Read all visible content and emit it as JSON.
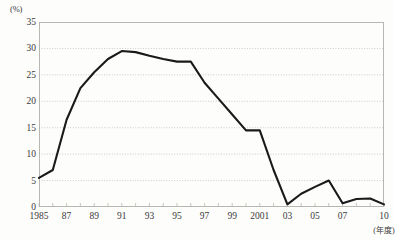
{
  "chart_data": {
    "type": "line",
    "title": "",
    "xlabel": "(年度)",
    "ylabel": "(%)",
    "unit_label": "(%)",
    "x_axis_caption": "(年度)",
    "grid": true,
    "legend": "none",
    "xlim": [
      1985,
      2010
    ],
    "ylim": [
      0,
      35
    ],
    "y_ticks": [
      0,
      5,
      10,
      15,
      20,
      25,
      30,
      35
    ],
    "y_tick_labels": [
      "0",
      "5",
      "10",
      "15",
      "20",
      "25",
      "30",
      "35"
    ],
    "x_ticks": [
      1985,
      1986,
      1987,
      1988,
      1989,
      1990,
      1991,
      1992,
      1993,
      1994,
      1995,
      1996,
      1997,
      1998,
      1999,
      2000,
      2001,
      2002,
      2003,
      2004,
      2005,
      2006,
      2007,
      2008,
      2009,
      2010
    ],
    "x_tick_labels": [
      {
        "x": 1985,
        "label": "1985"
      },
      {
        "x": 1987,
        "label": "87"
      },
      {
        "x": 1989,
        "label": "89"
      },
      {
        "x": 1991,
        "label": "91"
      },
      {
        "x": 1993,
        "label": "93"
      },
      {
        "x": 1995,
        "label": "95"
      },
      {
        "x": 1997,
        "label": "97"
      },
      {
        "x": 1999,
        "label": "99"
      },
      {
        "x": 2001,
        "label": "2001"
      },
      {
        "x": 2003,
        "label": "03"
      },
      {
        "x": 2005,
        "label": "05"
      },
      {
        "x": 2007,
        "label": "07"
      },
      {
        "x": 2010,
        "label": "10"
      }
    ],
    "x": [
      1985,
      1986,
      1987,
      1988,
      1989,
      1990,
      1991,
      1992,
      1993,
      1994,
      1995,
      1996,
      1997,
      1998,
      1999,
      2000,
      2001,
      2002,
      2003,
      2004,
      2005,
      2006,
      2007,
      2008,
      2009,
      2010
    ],
    "values": [
      5.5,
      7.0,
      16.5,
      22.5,
      25.5,
      28.0,
      29.5,
      29.3,
      28.6,
      28.0,
      27.5,
      27.5,
      23.5,
      20.5,
      17.5,
      14.5,
      14.5,
      7.0,
      0.5,
      2.5,
      3.8,
      5.0,
      0.7,
      1.5,
      1.6,
      0.5
    ],
    "series": [
      {
        "name": "",
        "color": "#1a1a1a",
        "values": [
          5.5,
          7.0,
          16.5,
          22.5,
          25.5,
          28.0,
          29.5,
          29.3,
          28.6,
          28.0,
          27.5,
          27.5,
          23.5,
          20.5,
          17.5,
          14.5,
          14.5,
          7.0,
          0.5,
          2.5,
          3.8,
          5.0,
          0.7,
          1.5,
          1.6,
          0.5
        ]
      }
    ],
    "colors": {
      "line": "#1a1a1a",
      "grid": "#a9a9a9",
      "frame": "#b9b7b2",
      "text": "#3a3a3a",
      "background": "#fdfdfc"
    }
  }
}
